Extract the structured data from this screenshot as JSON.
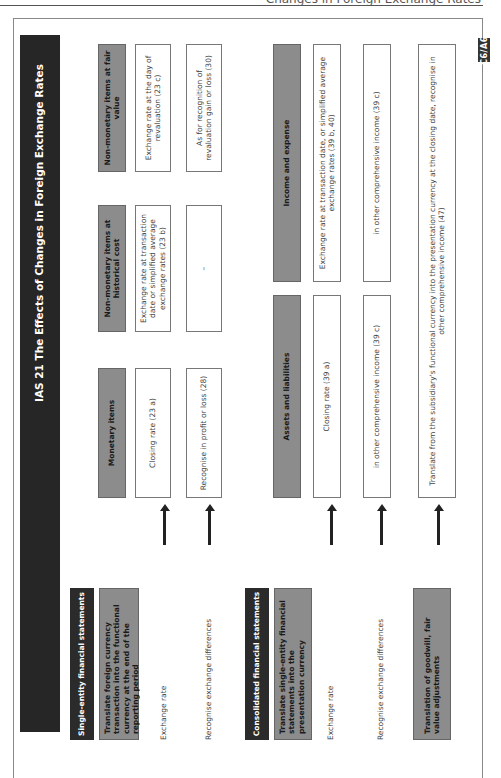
{
  "running_head": "Changes in Foreign Exchange Rates",
  "badge": "C6/A6",
  "title": "IAS 21 The Effects of Changes in Foreign Exchange Rates",
  "single_entity": {
    "header": "Single-entity financial statements",
    "description": "Translate foreign currency transaction into the functional currency at the end of the reporting period",
    "row_labels": {
      "exchange_rate": "Exchange rate",
      "recognise": "Recognise exchange differences"
    },
    "columns": [
      {
        "header": "Monetary items",
        "exchange_rate": "Closing rate (23 a)",
        "recognise": "Recognise in profit or loss (28)"
      },
      {
        "header": "Non-monetary items at historical cost",
        "exchange_rate": "Exchange rate at transaction date or simplified average exchange rates (23 b)",
        "recognise": "–"
      },
      {
        "header": "Non-monetary items at fair value",
        "exchange_rate": "Exchange rate at the day of revaluation (23 c)",
        "recognise": "As for recognition of revaluation gain or loss (30)"
      }
    ]
  },
  "consolidated": {
    "header": "Consolidated financial statements",
    "description": "Translate single-entity financial statements into the presentation currency",
    "row_labels": {
      "exchange_rate": "Exchange rate",
      "recognise": "Recognise exchange differences"
    },
    "columns": [
      {
        "header": "Assets and liabilities",
        "exchange_rate": "Closing rate (39 a)",
        "recognise": "in other comprehensive income (39 c)"
      },
      {
        "header": "Income and expense",
        "exchange_rate": "Exchange rate at transaction date, or simplified average exchange rates (39 b, 40)",
        "recognise": "in other comprehensive income (39 c)"
      }
    ],
    "goodwill": {
      "label": "Translation of goodwill, fair value adjustments",
      "treatment": "Translate from the subsidiary's functional currency into the presentation currency at the closing date, recognise in other comprehensive income (47)"
    }
  }
}
